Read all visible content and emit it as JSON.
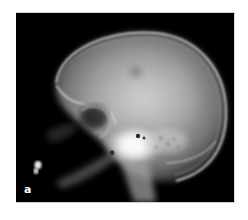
{
  "figure": {
    "type": "radiograph",
    "view": "lateral skull x-ray",
    "panel_label": "a",
    "colors": {
      "background": "#000000",
      "page": "#ffffff",
      "bone_bright": "#f4f4f4",
      "bone_mid": "#9a9a9a",
      "soft_tissue": "#3a3a3a"
    }
  }
}
